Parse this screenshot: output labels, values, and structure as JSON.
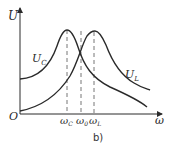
{
  "figure": {
    "caption": "b)",
    "y_axis_label": "U",
    "x_axis_label": "ω",
    "origin_label": "O",
    "curves": [
      {
        "name": "U_C",
        "label_main": "U",
        "label_sub": "C"
      },
      {
        "name": "U_L",
        "label_main": "U",
        "label_sub": "L"
      }
    ],
    "x_markers": [
      {
        "label_main": "ω",
        "label_sub": "C"
      },
      {
        "label_main": "ω",
        "label_sub": "0"
      },
      {
        "label_main": "ω",
        "label_sub": "L"
      }
    ],
    "colors": {
      "line": "#2a2a2a",
      "dashed": "#777777"
    }
  }
}
